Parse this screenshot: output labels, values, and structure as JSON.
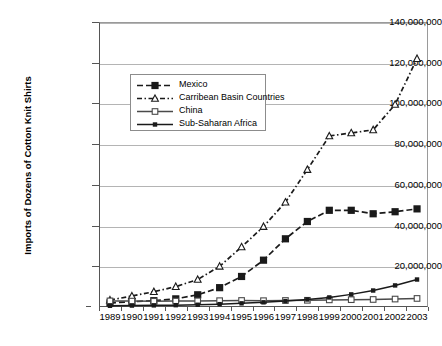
{
  "chart_data": {
    "type": "line",
    "title": "",
    "xlabel": "",
    "ylabel": "Imports of Dozens of Cotton Knit Shirts",
    "ylim": [
      0,
      140000000
    ],
    "ytick_step": 20000000,
    "grid": true,
    "legend_position": "upper-left-inside",
    "categories": [
      "1989",
      "1990",
      "1991",
      "1992",
      "1993",
      "1994",
      "1995",
      "1996",
      "1997",
      "1998",
      "1999",
      "2000",
      "2001",
      "2002",
      "2003"
    ],
    "ytick_labels": [
      "0",
      "20,000,000",
      "40,000,000",
      "60,000,000",
      "80,000,000",
      "100,000,000",
      "120,000,000",
      "140,000,000"
    ],
    "series": [
      {
        "name": "Mexico",
        "marker": "filled-square",
        "line_style": "dashed",
        "color": "#1a1a1a",
        "values": [
          2000000,
          2600000,
          3100000,
          4000000,
          6000000,
          9500000,
          15000000,
          23000000,
          33500000,
          42000000,
          47500000,
          47500000,
          45800000,
          46800000,
          48200000
        ]
      },
      {
        "name": "Carribean Basin Countries",
        "marker": "open-triangle",
        "line_style": "dash-dot",
        "color": "#1a1a1a",
        "values": [
          3400000,
          5400000,
          7500000,
          10000000,
          13500000,
          20000000,
          29500000,
          39500000,
          51500000,
          67500000,
          84000000,
          85500000,
          87000000,
          99500000,
          122000000
        ]
      },
      {
        "name": "China",
        "marker": "open-square",
        "line_style": "solid",
        "color": "#4a4a4a",
        "values": [
          3000000,
          2900000,
          2800000,
          2900000,
          3000000,
          3100000,
          3200000,
          3100000,
          3200000,
          3300000,
          3500000,
          3600000,
          3700000,
          3900000,
          4200000
        ]
      },
      {
        "name": "Sub-Saharan Africa",
        "marker": "filled-square-small",
        "line_style": "solid",
        "color": "#1a1a1a",
        "values": [
          600000,
          700000,
          800000,
          900000,
          1100000,
          1400000,
          1800000,
          2300000,
          2900000,
          3700000,
          4700000,
          6200000,
          8100000,
          10600000,
          13500000
        ]
      }
    ]
  }
}
